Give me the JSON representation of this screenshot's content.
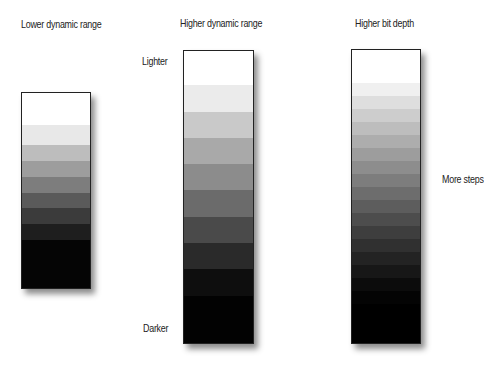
{
  "titles": {
    "lower": "Lower dynamic range",
    "higher": "Higher dynamic range",
    "bitdepth": "Higher bit depth"
  },
  "annotations": {
    "lighter": "Lighter",
    "darker": "Darker",
    "more_steps": "More steps"
  },
  "bars": {
    "lower": {
      "bands": [
        {
          "color": "#ffffff",
          "weight": 1.6
        },
        {
          "color": "#e8e8e8",
          "weight": 1
        },
        {
          "color": "#bdbdbd",
          "weight": 0.8
        },
        {
          "color": "#9d9d9d",
          "weight": 0.8
        },
        {
          "color": "#7d7d7d",
          "weight": 0.8
        },
        {
          "color": "#5a5a5a",
          "weight": 0.8
        },
        {
          "color": "#3b3b3b",
          "weight": 0.8
        },
        {
          "color": "#1e1e1e",
          "weight": 0.8
        },
        {
          "color": "#050505",
          "weight": 2.4
        }
      ]
    },
    "higher": {
      "bands": [
        {
          "color": "#ffffff",
          "weight": 1.3
        },
        {
          "color": "#ebebeb",
          "weight": 1
        },
        {
          "color": "#c9c9c9",
          "weight": 1
        },
        {
          "color": "#a9a9a9",
          "weight": 1
        },
        {
          "color": "#8c8c8c",
          "weight": 1
        },
        {
          "color": "#6b6b6b",
          "weight": 1
        },
        {
          "color": "#4a4a4a",
          "weight": 1
        },
        {
          "color": "#2a2a2a",
          "weight": 1
        },
        {
          "color": "#0e0e0e",
          "weight": 1
        },
        {
          "color": "#020202",
          "weight": 1.8
        }
      ]
    },
    "bitdepth": {
      "bands": [
        {
          "color": "#ffffff",
          "weight": 2.5
        },
        {
          "color": "#f0f0f0",
          "weight": 1
        },
        {
          "color": "#dedede",
          "weight": 1
        },
        {
          "color": "#cdcdcd",
          "weight": 1
        },
        {
          "color": "#bdbdbd",
          "weight": 1
        },
        {
          "color": "#adadad",
          "weight": 1
        },
        {
          "color": "#9d9d9d",
          "weight": 1
        },
        {
          "color": "#8d8d8d",
          "weight": 1
        },
        {
          "color": "#7d7d7d",
          "weight": 1
        },
        {
          "color": "#6d6d6d",
          "weight": 1
        },
        {
          "color": "#5d5d5d",
          "weight": 1
        },
        {
          "color": "#4d4d4d",
          "weight": 1
        },
        {
          "color": "#3e3e3e",
          "weight": 1
        },
        {
          "color": "#303030",
          "weight": 1
        },
        {
          "color": "#232323",
          "weight": 1
        },
        {
          "color": "#171717",
          "weight": 1
        },
        {
          "color": "#0c0c0c",
          "weight": 1
        },
        {
          "color": "#040404",
          "weight": 1
        },
        {
          "color": "#000000",
          "weight": 3
        }
      ]
    }
  }
}
